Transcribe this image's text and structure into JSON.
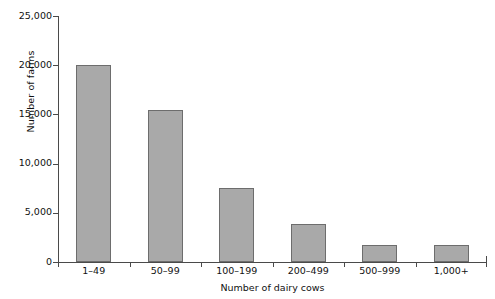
{
  "chart_data": {
    "type": "bar",
    "title": "",
    "xlabel": "Number of dairy cows",
    "ylabel": "Number of farms",
    "categories": [
      "1–49",
      "50–99",
      "100–199",
      "200–499",
      "500–999",
      "1,000+"
    ],
    "values": [
      20000,
      15400,
      7500,
      3900,
      1700,
      1750
    ],
    "ylim": [
      0,
      25000
    ],
    "yticks": [
      0,
      5000,
      10000,
      15000,
      20000,
      25000
    ],
    "ytick_labels": [
      "0",
      "5,000",
      "10,000",
      "15,000",
      "20,000",
      "25,000"
    ],
    "grid": false,
    "legend": null,
    "series": [
      {
        "name": "Number of farms",
        "values": [
          20000,
          15400,
          7500,
          3900,
          1700,
          1750
        ]
      }
    ],
    "colors": {
      "bar_fill": "#a9a9a9",
      "bar_border": "#6d6d6d",
      "axis": "#4a4a4a",
      "text": "#111111",
      "background": "#ffffff"
    }
  }
}
